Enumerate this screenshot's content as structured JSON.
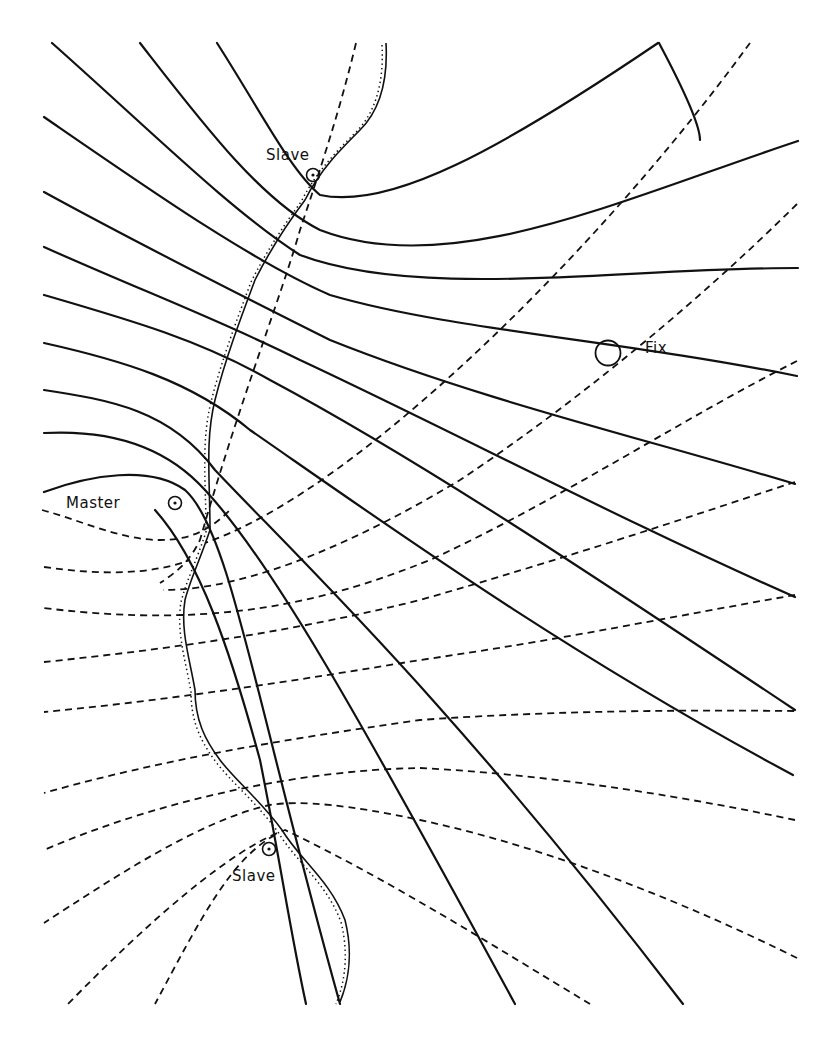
{
  "figure": {
    "type": "hyperbolic navigation (LORAN) lattice diagram",
    "line_color": "#111111",
    "background": "#ffffff"
  },
  "labels": {
    "slave_north": "Slave",
    "slave_south": "Slave",
    "master": "Master",
    "fix": "Fix"
  },
  "stations": {
    "master": {
      "x": 175,
      "y": 503
    },
    "slave_north": {
      "x": 313,
      "y": 175
    },
    "slave_south": {
      "x": 269,
      "y": 849
    },
    "fix": {
      "x": 608,
      "y": 353
    }
  },
  "legend": {
    "solid_lines": "Lines of position from Master / north Slave pair",
    "dashed_lines": "Lines of position from Master / south Slave pair",
    "hatched_line": "Coastline"
  }
}
